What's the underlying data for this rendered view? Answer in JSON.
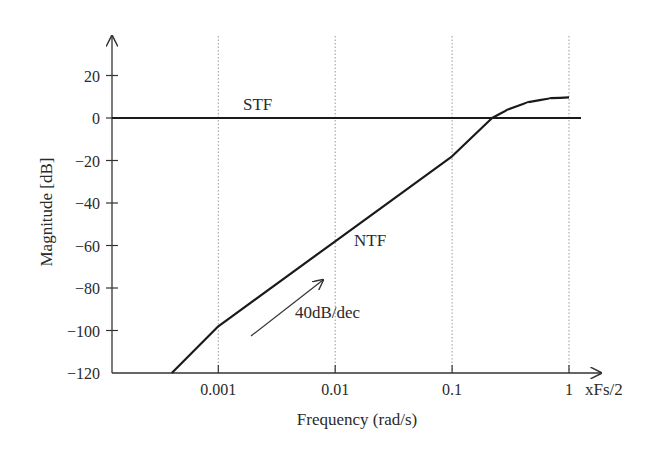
{
  "chart_data": {
    "type": "line",
    "title": "",
    "xlabel": "Frequency (rad/s)",
    "ylabel": "Magnitude [dB]",
    "x_scale": "log",
    "x_unit_suffix": "xFs/2",
    "xticks": [
      {
        "value": 0.001,
        "label": "0.001"
      },
      {
        "value": 0.01,
        "label": "0.01"
      },
      {
        "value": 0.1,
        "label": "0.1"
      },
      {
        "value": 1,
        "label": "1"
      }
    ],
    "yticks": [
      {
        "value": 20,
        "label": "20"
      },
      {
        "value": 0,
        "label": "0"
      },
      {
        "value": -20,
        "label": "−20"
      },
      {
        "value": -40,
        "label": "−40"
      },
      {
        "value": -60,
        "label": "−60"
      },
      {
        "value": -80,
        "label": "−80"
      },
      {
        "value": -100,
        "label": "−100"
      },
      {
        "value": -120,
        "label": "−120"
      }
    ],
    "xlim": [
      0.00016,
      2.0
    ],
    "ylim": [
      -120,
      30
    ],
    "grid": {
      "x": "dotted-vertical",
      "y": false
    },
    "legend": "none (inline labels)",
    "series": [
      {
        "name": "STF",
        "x": [
          0.00016,
          2.0
        ],
        "y": [
          0,
          0
        ]
      },
      {
        "name": "NTF",
        "x": [
          0.0004,
          0.001,
          0.01,
          0.1,
          0.22,
          0.3,
          0.45,
          0.7,
          1.0
        ],
        "y": [
          -120,
          -98,
          -58,
          -18,
          0,
          4,
          7.5,
          9.3,
          9.7
        ]
      }
    ],
    "annotations": [
      {
        "text": "STF",
        "near": "STF line, left of 0.01"
      },
      {
        "text": "NTF",
        "near": "NTF line, right of 0.01"
      },
      {
        "text": "40dB/dec",
        "arrow": "parallel to NTF slope, below line near 0.002-0.008"
      }
    ]
  },
  "labels": {
    "stf": "STF",
    "ntf": "NTF",
    "slope": "40dB/dec",
    "xlabel": "Frequency (rad/s)",
    "ylabel": "Magnitude [dB]",
    "x_unit": "xFs/2"
  },
  "style": {
    "line_color": "#1a1a1a",
    "grid_color": "#9a9a9a",
    "axis_color": "#333333"
  }
}
